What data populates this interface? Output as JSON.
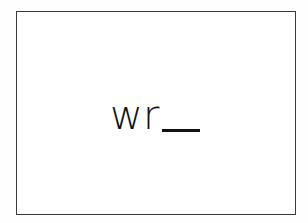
{
  "canvas": {
    "width": 308,
    "height": 223,
    "background_color": "#fefefe"
  },
  "frame": {
    "name": "bordered-content-box",
    "border_color": "#3a3a3c",
    "fill_color": "#ffffff",
    "border_width_px": 1.5,
    "left": 16,
    "top": 11,
    "width": 280,
    "height": 204
  },
  "content": {
    "text": "wr",
    "trailing_underscore": "_",
    "full_text": "wr_",
    "text_color": "#111113",
    "font_size_px": 40,
    "font_weight": "light",
    "align": "center"
  }
}
